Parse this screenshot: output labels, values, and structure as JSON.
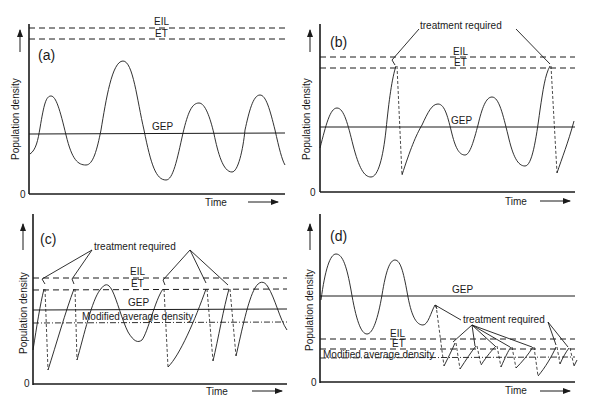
{
  "figure": {
    "common": {
      "y_axis_label": "Population density",
      "x_axis_label": "Time",
      "origin_label": "0",
      "eil_label": "EIL",
      "et_label": "ET",
      "gep_label": "GEP",
      "mad_label": "Modified average density",
      "treatment_label": "treatment required"
    },
    "panels": [
      {
        "id": "a",
        "label": "(a)",
        "description": "Population fluctuates around GEP, never reaching ET/EIL; no treatment required"
      },
      {
        "id": "b",
        "label": "(b)",
        "description": "Occasional peaks exceed ET; treatment required twice"
      },
      {
        "id": "c",
        "label": "(c)",
        "description": "GEP close to ET; frequent treatments; modified average density below GEP"
      },
      {
        "id": "d",
        "label": "(d)",
        "description": "GEP above EIL; treatment lowers population repeatedly; modified average density below ET"
      }
    ]
  }
}
